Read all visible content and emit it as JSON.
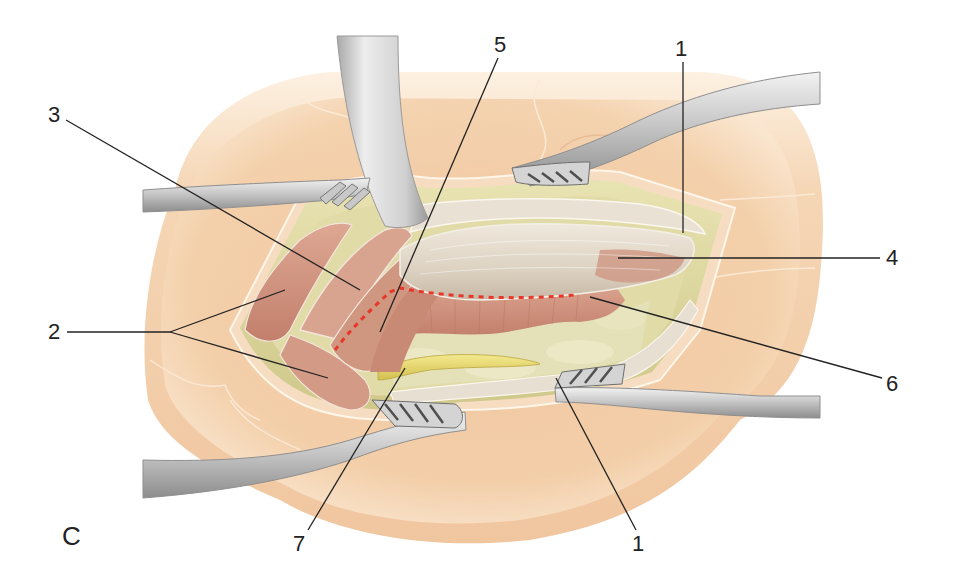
{
  "figure": {
    "panel_letter": "C",
    "colors": {
      "skin": "#f3cfa9",
      "skin_shadow": "#e7b48a",
      "fat": "#d9d49a",
      "fat_light": "#eae6b8",
      "muscle": "#d49a86",
      "muscle_dark": "#b9786a",
      "tendon": "#e6ddd0",
      "nerve": "#e5d66a",
      "retractor": "#c9c9c9",
      "retractor_dark": "#8f8f8f",
      "incision_line": "#e8372a",
      "leader_line": "#222222"
    }
  },
  "labels": [
    {
      "id": "1",
      "text": "1",
      "x": 675,
      "y": 52
    },
    {
      "id": "1b",
      "text": "1",
      "x": 634,
      "y": 537
    },
    {
      "id": "2",
      "text": "2",
      "x": 48,
      "y": 320
    },
    {
      "id": "3",
      "text": "3",
      "x": 48,
      "y": 108
    },
    {
      "id": "4",
      "text": "4",
      "x": 886,
      "y": 247
    },
    {
      "id": "5",
      "text": "5",
      "x": 494,
      "y": 37
    },
    {
      "id": "6",
      "text": "6",
      "x": 886,
      "y": 373
    },
    {
      "id": "7",
      "text": "7",
      "x": 295,
      "y": 537
    }
  ]
}
